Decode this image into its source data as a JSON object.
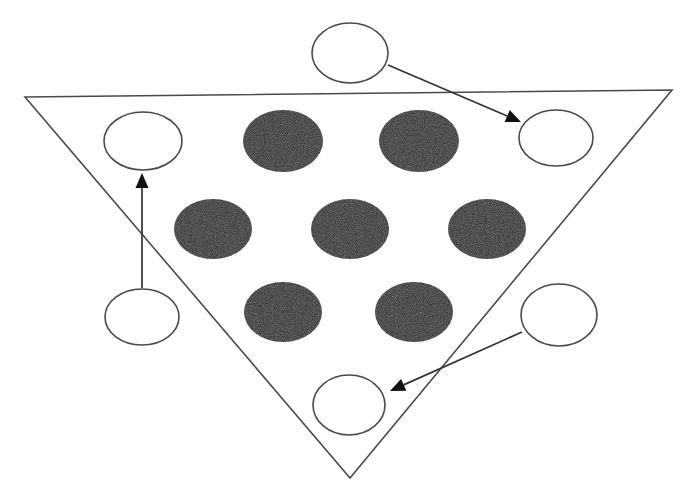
{
  "figure": {
    "canvas": {
      "width": 689,
      "height": 501,
      "background": "#ffffff"
    },
    "colors": {
      "outline_stroke": "#4a4a4a",
      "filled_circle_fill": "#1a1a1a",
      "open_circle_fill": "#ffffff",
      "arrow_stroke": "#333333",
      "arrow_head_fill": "#111111"
    },
    "triangle": {
      "name": "inverted-triangle",
      "vertices": [
        {
          "label": "top-left",
          "x": 25,
          "y": 97
        },
        {
          "label": "top-right",
          "x": 672,
          "y": 90
        },
        {
          "label": "bottom",
          "x": 350,
          "y": 478
        }
      ],
      "stroke_width": 1.6
    },
    "filled_circles": [
      {
        "id": "filled-1",
        "row": 1,
        "col": 1,
        "cx": 283,
        "cy": 141,
        "rx": 40,
        "ry": 31
      },
      {
        "id": "filled-2",
        "row": 1,
        "col": 2,
        "cx": 419,
        "cy": 141,
        "rx": 40,
        "ry": 31
      },
      {
        "id": "filled-3",
        "row": 2,
        "col": 1,
        "cx": 213,
        "cy": 229,
        "rx": 39,
        "ry": 30
      },
      {
        "id": "filled-4",
        "row": 2,
        "col": 2,
        "cx": 350,
        "cy": 229,
        "rx": 39,
        "ry": 30
      },
      {
        "id": "filled-5",
        "row": 2,
        "col": 3,
        "cx": 487,
        "cy": 229,
        "rx": 39,
        "ry": 30
      },
      {
        "id": "filled-6",
        "row": 3,
        "col": 1,
        "cx": 283,
        "cy": 312,
        "rx": 39,
        "ry": 30
      },
      {
        "id": "filled-7",
        "row": 3,
        "col": 2,
        "cx": 414,
        "cy": 312,
        "rx": 39,
        "ry": 30
      }
    ],
    "open_circles": [
      {
        "id": "open-top",
        "position": "top-outside",
        "cx": 350,
        "cy": 53,
        "rx": 38,
        "ry": 30
      },
      {
        "id": "open-top-left",
        "position": "inside-upper-left",
        "cx": 143,
        "cy": 141,
        "rx": 39,
        "ry": 29
      },
      {
        "id": "open-top-right",
        "position": "inside-upper-right",
        "cx": 556,
        "cy": 138,
        "rx": 37,
        "ry": 28
      },
      {
        "id": "open-bottom-left",
        "position": "outside-lower-left",
        "cx": 142,
        "cy": 317,
        "rx": 37,
        "ry": 28
      },
      {
        "id": "open-bottom-right",
        "position": "outside-lower-right",
        "cx": 559,
        "cy": 315,
        "rx": 38,
        "ry": 31
      },
      {
        "id": "open-bottom-center",
        "position": "inside-lower-center",
        "cx": 349,
        "cy": 405,
        "rx": 36,
        "ry": 30
      }
    ],
    "arrows": [
      {
        "id": "arrow-top",
        "from": "open-top",
        "to": "open-top-right",
        "x1": 388,
        "y1": 65,
        "x2": 521,
        "y2": 122,
        "head_angle_deg": 23
      },
      {
        "id": "arrow-left",
        "from": "open-bottom-left",
        "to": "open-top-left",
        "x1": 142,
        "y1": 288,
        "x2": 142,
        "y2": 173,
        "head_angle_deg": -90
      },
      {
        "id": "arrow-bottom",
        "from": "open-bottom-right",
        "to": "open-bottom-center",
        "x1": 522,
        "y1": 332,
        "x2": 390,
        "y2": 391,
        "head_angle_deg": 156
      }
    ],
    "counts": {
      "filled_circles": 7,
      "open_circles": 6,
      "arrows": 3
    }
  }
}
